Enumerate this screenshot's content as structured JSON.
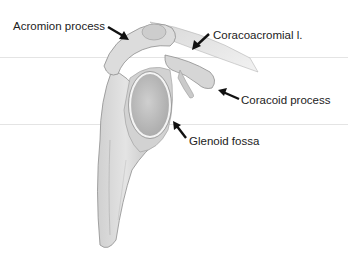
{
  "figure": {
    "labels": [
      {
        "id": "acromion",
        "text": "Acromion process"
      },
      {
        "id": "coracoacromial",
        "text": "Coracoacromial l."
      },
      {
        "id": "coracoid",
        "text": "Coracoid process"
      },
      {
        "id": "glenoid",
        "text": "Glenoid fossa"
      }
    ],
    "colors": {
      "bone_light": "#e6e6e6",
      "bone_mid": "#c4c4c4",
      "bone_dark": "#8e8e8e",
      "arrow": "#111111",
      "label_text": "#222222"
    }
  }
}
